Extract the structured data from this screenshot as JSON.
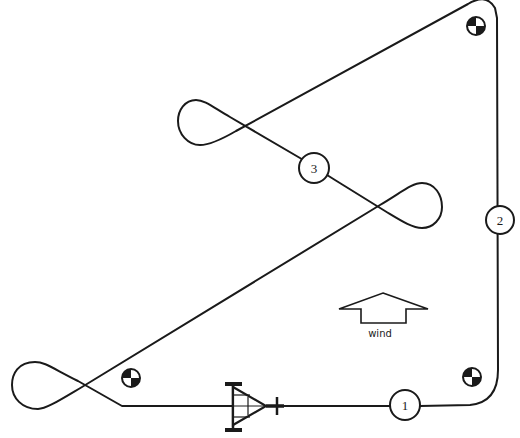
{
  "diagram": {
    "type": "aerobatic/glider flight course",
    "waypoints": [
      {
        "id": "1",
        "label": "1"
      },
      {
        "id": "2",
        "label": "2"
      },
      {
        "id": "3",
        "label": "3"
      }
    ],
    "wind": {
      "label": "wind",
      "direction": "up"
    },
    "markers": [
      {
        "name": "pylon-marker-bottom-left"
      },
      {
        "name": "pylon-marker-bottom-right"
      },
      {
        "name": "pylon-marker-top-right"
      }
    ],
    "aircraft": {
      "name": "aircraft-start-symbol"
    },
    "colors": {
      "line": "#1a1a1a",
      "background": "#ffffff"
    }
  }
}
